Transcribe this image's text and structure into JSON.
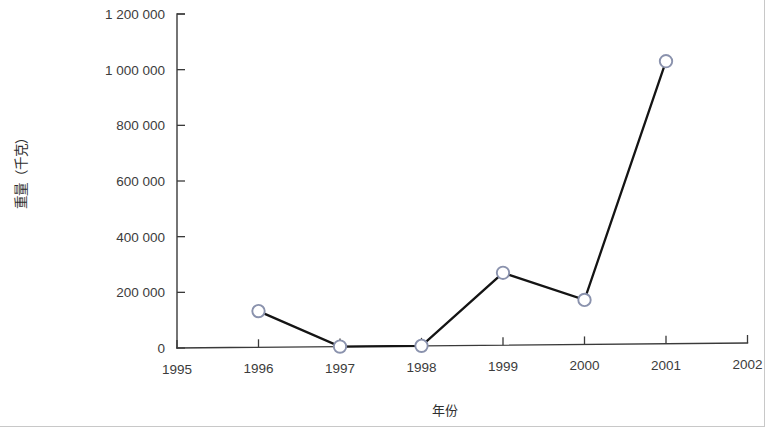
{
  "chart_data": {
    "type": "line",
    "title": "",
    "xlabel": "年份",
    "ylabel": "重量（千克）",
    "x": [
      1995,
      1996,
      1997,
      1998,
      1999,
      2000,
      2001,
      2002
    ],
    "xtick_labels": [
      "1995",
      "1996",
      "1997",
      "1998",
      "1999",
      "2000",
      "2001",
      "2002"
    ],
    "ytick_labels": [
      "0",
      "200 000",
      "400 000",
      "600 000",
      "800 000",
      "1 000 000",
      "1 200 000"
    ],
    "ytick_values": [
      0,
      200000,
      400000,
      600000,
      800000,
      1000000,
      1200000
    ],
    "xlim": [
      1995,
      2002
    ],
    "ylim": [
      0,
      1200000
    ],
    "grid": false,
    "legend": null,
    "series": [
      {
        "name": "重量（千克）",
        "marker": "open-circle",
        "line_color": "#141414",
        "marker_edge_color": "#8a92ad",
        "marker_face_color": "#ffffff",
        "points": [
          {
            "x": 1996,
            "y": 130000
          },
          {
            "x": 1997,
            "y": 0
          },
          {
            "x": 1998,
            "y": 0
          },
          {
            "x": 1999,
            "y": 260000
          },
          {
            "x": 2000,
            "y": 160000
          },
          {
            "x": 2001,
            "y": 1015000
          }
        ]
      }
    ]
  },
  "colors": {
    "background": "#ffffff",
    "axis": "#3a3a3a",
    "line": "#141414",
    "marker_edge": "#8a92ad",
    "text": "#3c3c3c"
  }
}
